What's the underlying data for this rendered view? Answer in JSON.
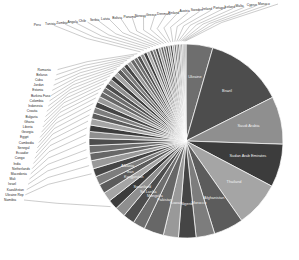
{
  "chart_data": {
    "type": "pie",
    "title": "",
    "subtitle": "",
    "xlabel": "",
    "ylabel": "",
    "legend_position": "none",
    "grid": false,
    "label_style": "leader-lines",
    "palette": [
      "#6e6e6e",
      "#4d4d4d",
      "#8f8f8f",
      "#3c3c3c",
      "#a5a5a5",
      "#5c5c5c",
      "#7d7d7d",
      "#454545",
      "#999999",
      "#676767"
    ],
    "categories": [
      "Ukraine",
      "Brazil",
      "Saudi Arabia",
      "Sudan Arab Emirates",
      "Thailand",
      "Afghanistan",
      "Morocco",
      "Nigeria",
      "Kuwait",
      "Pakistan",
      "Mongolia",
      "Sri Lanka",
      "Swaziland",
      "Namibia",
      "Kyrgyzstan",
      "Iran",
      "Albania",
      "Ukraine Rep",
      "Kazakhstan",
      "Israel",
      "Mali",
      "Macedonia",
      "Netherlands",
      "India",
      "Congo",
      "Ecuador",
      "Senegal",
      "Cambodia",
      "Egypt",
      "Georgia",
      "Liberia",
      "Ghana",
      "Bulgaria",
      "Croatia",
      "Indonesia",
      "Colombia",
      "Burkina Faso",
      "Estonia",
      "Jordan",
      "Cuba",
      "Belarus",
      "Romania",
      "Peru",
      "Tunisia",
      "Zambia",
      "Angola",
      "Chile",
      "Serbia",
      "Latvia",
      "Bolivia",
      "Panama",
      "Norway",
      "Greece",
      "Denmark",
      "Finland",
      "Austria",
      "Sweden",
      "Ireland",
      "Portugal",
      "Iceland",
      "Malta",
      "Cyprus",
      "Monaco"
    ],
    "values": [
      4.6,
      13.5,
      8.2,
      7.4,
      7.8,
      5.1,
      3.2,
      3.0,
      2.6,
      3.4,
      2.1,
      2.0,
      1.8,
      1.7,
      1.6,
      1.6,
      1.5,
      1.4,
      1.4,
      1.3,
      1.3,
      1.2,
      1.2,
      1.1,
      1.1,
      1.0,
      1.0,
      1.0,
      0.95,
      0.9,
      0.9,
      0.85,
      0.85,
      0.8,
      0.8,
      0.75,
      0.75,
      0.7,
      0.7,
      0.68,
      0.65,
      0.62,
      0.6,
      0.58,
      0.55,
      0.52,
      0.5,
      0.48,
      0.46,
      0.44,
      0.42,
      0.4,
      0.38,
      0.36,
      0.34,
      0.32,
      0.3,
      0.28,
      0.26,
      0.24,
      0.22,
      0.2,
      0.18
    ],
    "inner_labeled": [
      "Brazil",
      "Saudi Arabia",
      "Sudan Arab Emirates",
      "Thailand",
      "Afghanistan",
      "Morocco",
      "Nigeria",
      "Kuwait",
      "Pakistan",
      "Mongolia",
      "Sri Lanka",
      "Swaziland",
      "Kyrgyzstan",
      "Iran",
      "Albania",
      "Ukraine"
    ]
  },
  "figure": {
    "background_color": "#ffffff",
    "center_x": 186,
    "center_y": 141,
    "radius": 97
  }
}
